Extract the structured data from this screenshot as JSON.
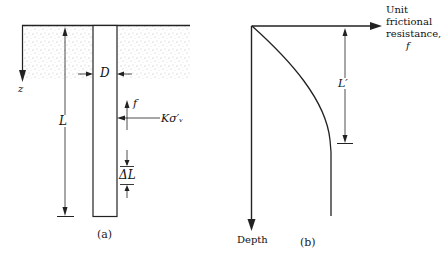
{
  "panel_a": {
    "caption": "(a)",
    "labels": {
      "z": "z",
      "D": "D",
      "L": "L",
      "f": "f",
      "K_sigma": "Kσ′ᵥ",
      "delta_L": "ΔL"
    }
  },
  "panel_b": {
    "caption": "(b)",
    "x_axis_label": [
      "Unit",
      "frictional",
      "resistance,",
      "f"
    ],
    "y_axis_label": "Depth",
    "L_prime": "L′"
  }
}
